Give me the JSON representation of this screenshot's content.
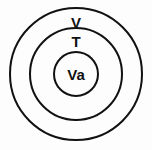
{
  "diagram": {
    "type": "concentric-circles",
    "title": "",
    "background_color": "#fdfdfd",
    "stroke_color": "#111111",
    "text_color": "#111111",
    "canvas": {
      "width": 152,
      "height": 150
    },
    "center": {
      "x": 76,
      "y": 74
    },
    "rings": [
      {
        "id": "outer",
        "label": "V",
        "radius": 66,
        "stroke_width": 2,
        "label_position": {
          "x": 76,
          "y": 24
        }
      },
      {
        "id": "middle",
        "label": "T",
        "radius": 46,
        "stroke_width": 2,
        "label_position": {
          "x": 76,
          "y": 43
        }
      },
      {
        "id": "inner",
        "label": "Va",
        "radius": 22,
        "stroke_width": 2,
        "label_position": {
          "x": 76,
          "y": 76
        }
      }
    ],
    "label_font_sizes": {
      "outer": 15,
      "middle": 15,
      "inner": 15
    }
  }
}
